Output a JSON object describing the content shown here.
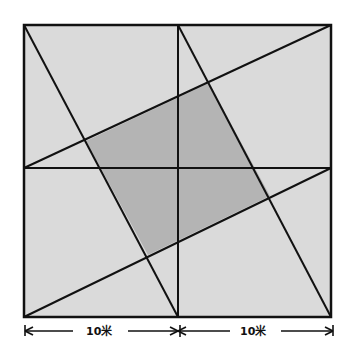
{
  "diagram": {
    "type": "geometry",
    "colors": {
      "background": "#ffffff",
      "square_fill": "#dadada",
      "shaded_fill": "#b4b4b4",
      "stroke": "#111111"
    },
    "square": {
      "x1": 24,
      "y1": 25,
      "x2": 331,
      "y2": 317
    },
    "midlines": {
      "vertical_x": 178,
      "horizontal_y": 168
    },
    "lines": [
      {
        "from": "top-left corner",
        "to": "bottom midpoint"
      },
      {
        "from": "top midpoint",
        "to": "bottom-right corner"
      },
      {
        "from": "bottom-left corner",
        "to": "right midpoint"
      },
      {
        "from": "left midpoint",
        "to": "top-right corner"
      }
    ],
    "shaded_region": "central quadrilateral",
    "dimensions": [
      {
        "label": "10米",
        "span": "left half"
      },
      {
        "label": "10米",
        "span": "right half"
      }
    ]
  }
}
